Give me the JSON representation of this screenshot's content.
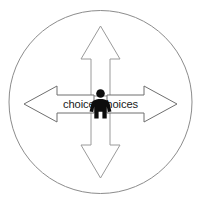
{
  "diagram": {
    "circle": {
      "name": "outer-circle",
      "center_x": 100,
      "center_y": 102,
      "radius": 92,
      "stroke_color": "#8c8c8c",
      "stroke_width": 1,
      "fill_color": "#ffffff"
    },
    "center_figure": {
      "name": "person-silhouette",
      "color": "#0d0d0d",
      "label": "person"
    },
    "arrows": [
      {
        "name": "arrow-up",
        "direction": "up",
        "label": "",
        "stroke_color": "#9a9a9a",
        "fill_color": "#ffffff"
      },
      {
        "name": "arrow-down",
        "direction": "down",
        "label": "",
        "stroke_color": "#9a9a9a",
        "fill_color": "#ffffff"
      },
      {
        "name": "arrow-left",
        "direction": "left",
        "label": "choices",
        "stroke_color": "#6f6f6f",
        "fill_color": "#ffffff"
      },
      {
        "name": "arrow-right",
        "direction": "right",
        "label": "choices",
        "stroke_color": "#6f6f6f",
        "fill_color": "#ffffff"
      }
    ],
    "background_color": "#ffffff"
  }
}
